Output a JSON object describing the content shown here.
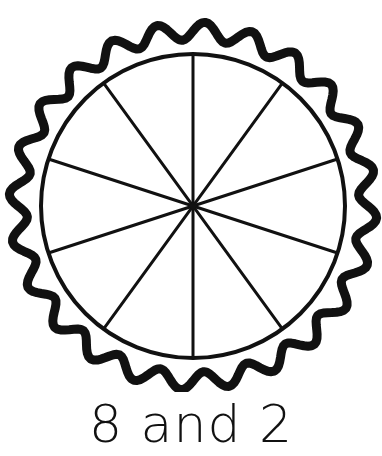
{
  "page": {
    "background_color": "#ffffff",
    "ink_color": "#111111"
  },
  "figure": {
    "name": "pie-divided-into-equal-slices",
    "crust": {
      "label": "scalloped pie crust",
      "scallop_count": 24,
      "stroke_width": 9,
      "color": "#111111",
      "outer_radius": 175,
      "scallop_amplitude": 9
    },
    "inner_circle": {
      "label": "pie filling circle",
      "radius": 152,
      "stroke_width": 4,
      "color": "#111111"
    },
    "center": {
      "cx": 193,
      "cy": 206
    },
    "slices": {
      "count": 10,
      "divider_count": 5,
      "divider_stroke_width": 3,
      "divider_color": "#111111",
      "start_angle_deg": -90,
      "angle_step_deg": 36,
      "divider_angles_deg": [
        -90,
        -54,
        -18,
        18,
        54
      ]
    }
  },
  "caption": {
    "text": "8 and 2",
    "first_number": "8",
    "conjunction": "and",
    "second_number": "2"
  },
  "chart_data": {
    "type": "pie",
    "title": "8 and 2",
    "categories": [
      "part one",
      "part two"
    ],
    "values": [
      8,
      2
    ],
    "total_slices": 10,
    "slice_value": 1,
    "labels": [
      "8",
      "2"
    ],
    "xlabel": "",
    "ylabel": "",
    "legend": false,
    "grid": false
  }
}
